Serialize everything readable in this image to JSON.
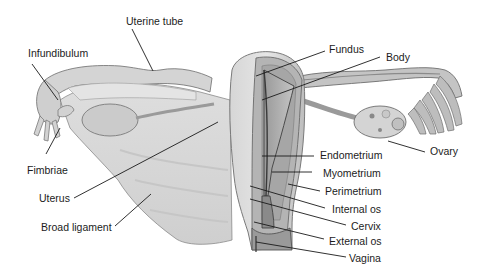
{
  "diagram": {
    "labels": {
      "uterine_tube": "Uterine tube",
      "infundibulum": "Infundibulum",
      "fimbriae": "Fimbriae",
      "uterus": "Uterus",
      "broad_ligament": "Broad ligament",
      "fundus": "Fundus",
      "body": "Body",
      "ovary": "Ovary",
      "endometrium": "Endometrium",
      "myometrium": "Myometrium",
      "perimetrium": "Perimetrium",
      "internal_os": "Internal os",
      "cervix": "Cervix",
      "external_os": "External os",
      "vagina": "Vagina"
    },
    "colors": {
      "background": "#ffffff",
      "tissue_light": "#dcdcdc",
      "tissue_mid": "#b8b8b8",
      "tissue_dark": "#8c8c8c",
      "outline": "#6e6e6e",
      "leader_line": "#1a1a1a",
      "label_text": "#1c1c1c"
    }
  }
}
